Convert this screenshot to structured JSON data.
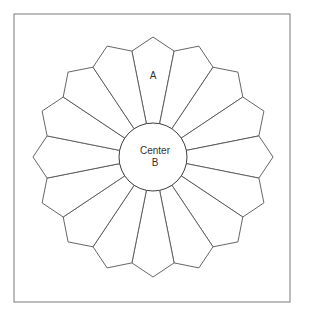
{
  "diagram": {
    "frame": {
      "x": 14,
      "y": 14,
      "width": 276,
      "height": 288,
      "stroke": "#7a7a7a"
    },
    "plate": {
      "center_x": 153,
      "center_y": 157,
      "blade_count": 16,
      "inner_radius": 34,
      "shoulder_radius": 108,
      "tip_radius": 120,
      "line_color": "#555555"
    },
    "labels": {
      "blade": "A",
      "center_line1": "Center",
      "center_line2": "B"
    },
    "label_positions": {
      "blade": {
        "x": 153,
        "y": 79
      },
      "center_line1": {
        "x": 155,
        "y": 154
      },
      "center_line2": {
        "x": 155,
        "y": 166
      }
    }
  }
}
